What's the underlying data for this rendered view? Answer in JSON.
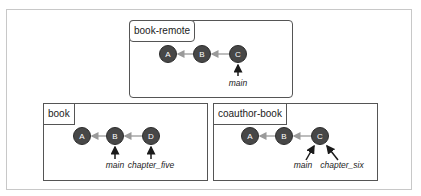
{
  "diagram": {
    "title": "",
    "repositories": [
      {
        "name": "book-remote",
        "commits": [
          "A",
          "B",
          "C"
        ],
        "refs": [
          {
            "label": "main",
            "points_to": "C"
          }
        ]
      },
      {
        "name": "book",
        "commits": [
          "A",
          "B",
          "D"
        ],
        "refs": [
          {
            "label": "main",
            "points_to": "B"
          },
          {
            "label": "chapter_five",
            "points_to": "D"
          }
        ]
      },
      {
        "name": "coauthor-book",
        "commits": [
          "A",
          "B",
          "C"
        ],
        "refs": [
          {
            "label": "main",
            "points_to": "C"
          },
          {
            "label": "chapter_six",
            "points_to": "C"
          }
        ]
      }
    ],
    "colors": {
      "commit_fill": "#474747",
      "commit_text": "#ffffff",
      "parent_edge": "#9a9a9a",
      "ref_arrow": "#1a1a1a",
      "box_border": "#555555",
      "outer_border": "#c8c8c8"
    }
  }
}
